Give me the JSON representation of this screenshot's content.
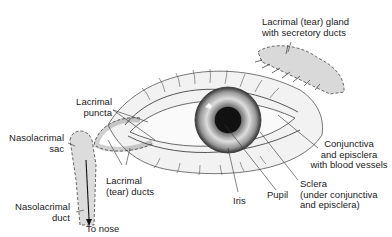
{
  "diagram": {
    "labels": {
      "lacrimal_gland": "Lacrimal (tear) gland\nwith secretory ducts",
      "lacrimal_puncta": "Lacrimal\npuncta",
      "nasolacrimal_sac": "Nasolacrimal\nsac",
      "lacrimal_ducts": "Lacrimal\n(tear) ducts",
      "nasolacrimal_duct": "Nasolacrimal\nduct",
      "to_nose": "To nose",
      "iris": "Iris",
      "pupil": "Pupil",
      "sclera": "Sclera\n(under conjunctiva\nand episclera)",
      "conjunctiva": "Conjunctiva\nand episclera\nwith blood vessels"
    },
    "colors": {
      "line": "#333333",
      "gland_fill": "#d9d9d9",
      "skin_fill": "#ececec",
      "pupil": "#111111"
    }
  }
}
